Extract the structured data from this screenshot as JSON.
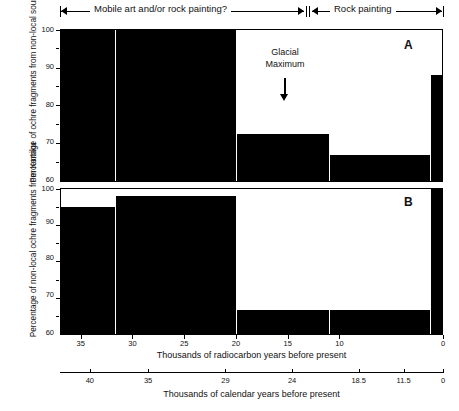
{
  "figure": {
    "title_brackets": [
      {
        "label": "Mobile art and/or rock painting?",
        "left_cap": "arrow-left",
        "right_cap": "arrow-right"
      },
      {
        "label": "Rock painting",
        "left_cap": "arrow-left",
        "right_cap": "arrow-right"
      }
    ],
    "annotation": {
      "line1": "Glacial",
      "line2": "Maximum",
      "marker": "down-arrow"
    },
    "panel_letters": {
      "a": "A",
      "b": "B"
    },
    "colors": {
      "bar": "#000000",
      "background": "#ffffff",
      "axis": "#000000"
    }
  },
  "chart_data": [
    {
      "type": "bar",
      "panel": "A",
      "title": "",
      "xlabel": "Thousands of radiocarbon years before present",
      "ylabel": "Percentage of ochre fragments from non-local sources",
      "ylim": [
        60,
        100
      ],
      "xlim": [
        37,
        0
      ],
      "yticks": [
        60,
        70,
        80,
        90,
        100
      ],
      "ytick_labels": [
        "60",
        "70",
        "80",
        "90",
        "100"
      ],
      "yminor": [
        65,
        75,
        85,
        95
      ],
      "xticks": [
        35,
        30,
        25,
        20,
        15,
        10,
        0
      ],
      "xtick_labels": [
        "35",
        "30",
        "25",
        "20",
        "15",
        "10",
        "0"
      ],
      "grid": false,
      "legend": "none",
      "bins": [
        {
          "x_start": 37.0,
          "x_end": 31.8,
          "value": 100
        },
        {
          "x_start": 31.8,
          "x_end": 20.0,
          "value": 100
        },
        {
          "x_start": 20.0,
          "x_end": 11.0,
          "value": 72.5
        },
        {
          "x_start": 11.0,
          "x_end": 1.2,
          "value": 67
        },
        {
          "x_start": 1.2,
          "x_end": 0.0,
          "value": 88
        }
      ]
    },
    {
      "type": "bar",
      "panel": "B",
      "title": "",
      "xlabel": "Thousands of radiocarbon years before present",
      "ylabel": "Percentage of non-local ochre fragments from Karriku",
      "ylim": [
        60,
        100
      ],
      "xlim": [
        37,
        0
      ],
      "yticks": [
        60,
        70,
        80,
        90,
        100
      ],
      "ytick_labels": [
        "60",
        "70",
        "80",
        "90",
        "100"
      ],
      "yminor": [
        65,
        75,
        85,
        95
      ],
      "xticks": [
        35,
        30,
        25,
        20,
        15,
        10,
        0
      ],
      "xtick_labels": [
        "35",
        "30",
        "25",
        "20",
        "15",
        "10",
        "0"
      ],
      "grid": false,
      "legend": "none",
      "bins": [
        {
          "x_start": 37.0,
          "x_end": 31.8,
          "value": 95
        },
        {
          "x_start": 31.8,
          "x_end": 20.0,
          "value": 98
        },
        {
          "x_start": 20.0,
          "x_end": 11.0,
          "value": 66.5
        },
        {
          "x_start": 11.0,
          "x_end": 1.2,
          "value": 66.5
        },
        {
          "x_start": 1.2,
          "x_end": 0.0,
          "value": 100
        }
      ]
    }
  ],
  "calendar_axis": {
    "label": "Thousands of calendar years before present",
    "ticks": [
      "40",
      "35",
      "29",
      "24",
      "18.5",
      "11.5",
      "0"
    ],
    "positions_pct": [
      7.8,
      23.0,
      43.2,
      60.6,
      78.0,
      89.7,
      100.0
    ]
  },
  "radiocarbon_axis": {
    "label": "Thousands of radiocarbon years before present"
  }
}
